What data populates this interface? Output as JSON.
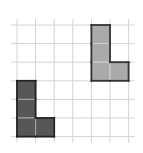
{
  "diagram": {
    "type": "grid-transformation",
    "grid": {
      "origin_x": 17,
      "origin_y": 25,
      "cell": 18.6,
      "cols": 6,
      "rows": 6,
      "line_color": "#d4d4d4",
      "extend": 6
    },
    "shapes": [
      {
        "name": "light-l-shape",
        "fill": "#aaaaaa",
        "stroke": "#333333",
        "inner_line": "#cfcfcf",
        "cells": [
          [
            4,
            0
          ],
          [
            4,
            1
          ],
          [
            4,
            2
          ],
          [
            5,
            2
          ]
        ]
      },
      {
        "name": "dark-l-shape",
        "fill": "#575757",
        "stroke": "#222222",
        "inner_line": "#a8a8a8",
        "cells": [
          [
            0,
            3
          ],
          [
            0,
            4
          ],
          [
            0,
            5
          ],
          [
            1,
            5
          ]
        ]
      }
    ]
  }
}
